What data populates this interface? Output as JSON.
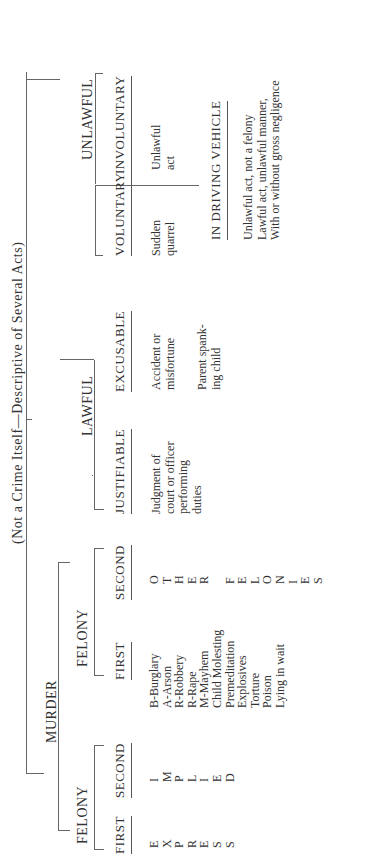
{
  "title": "(Not a Crime Itself—Descriptive of Several Acts)",
  "murder": {
    "label": "MURDER",
    "felony_left": {
      "label": "FELONY",
      "first": {
        "label": "FIRST",
        "letters": [
          "E",
          "X",
          "P",
          "R",
          "E",
          "S",
          "S"
        ]
      },
      "second": {
        "label": "SECOND",
        "letters": [
          "I",
          "M",
          "P",
          "L",
          "I",
          "E",
          "D"
        ]
      }
    },
    "felony_right": {
      "label": "FELONY",
      "first": {
        "label": "FIRST",
        "items": [
          "B-Burglary",
          "A-Arson",
          "R-Robbery",
          "R-Rape",
          "M-Mayhem",
          "Child Molesting",
          "Premeditation",
          "Explosives",
          "Torture",
          "Poison",
          "Lying in wait"
        ]
      },
      "second": {
        "label": "SECOND",
        "letters": [
          "O",
          "T",
          "H",
          "E",
          "R",
          " ",
          "F",
          "E",
          "L",
          "O",
          "N",
          "I",
          "E",
          "S"
        ]
      }
    }
  },
  "lawful": {
    "label": "LAWFUL",
    "justifiable": {
      "label": "JUSTIFIABLE",
      "lines": [
        "Judgment of",
        "court or officer",
        "performing",
        "duties"
      ]
    },
    "excusable": {
      "label": "EXCUSABLE",
      "lines": [
        "Accident or",
        "misfortune"
      ],
      "lines2": [
        "Parent spank-",
        "ing child"
      ]
    }
  },
  "unlawful": {
    "label": "UNLAWFUL",
    "voluntary": {
      "label": "VOLUNTARY",
      "lines": [
        "Sudden",
        "quarrel"
      ]
    },
    "involuntary": {
      "label": "INVOLUNTARY",
      "lines": [
        "Unlawful",
        "act"
      ]
    },
    "vehicle": {
      "label": "IN DRIVING VEHICLE",
      "lines": [
        "Unlawful act, not a felony",
        "Lawful act, unlawful manner,",
        "With or without gross negligence"
      ]
    }
  }
}
